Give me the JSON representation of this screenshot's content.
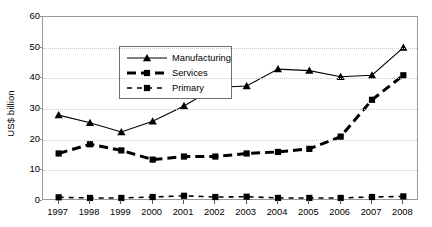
{
  "chart_data": {
    "type": "line",
    "title": "",
    "xlabel": "",
    "ylabel": "US$ billion",
    "ylim": [
      0,
      60
    ],
    "yticks": [
      0,
      10,
      20,
      30,
      40,
      50,
      60
    ],
    "grid": true,
    "legend_position": "upper-left-inside",
    "x": [
      1997,
      1998,
      1999,
      2000,
      2001,
      2002,
      2003,
      2004,
      2005,
      2006,
      2007,
      2008
    ],
    "categories": [
      "1997",
      "1998",
      "1999",
      "2000",
      "2001",
      "2002",
      "2003",
      "2004",
      "2005",
      "2006",
      "2007",
      "2008"
    ],
    "series": [
      {
        "name": "Manufacturing",
        "marker": "triangle",
        "line_style": "solid",
        "color": "#000000",
        "values": [
          28.0,
          25.5,
          22.5,
          26.0,
          31.0,
          37.0,
          37.5,
          43.0,
          42.5,
          40.5,
          41.0,
          50.0
        ]
      },
      {
        "name": "Services",
        "marker": "square",
        "line_style": "dashed-thick",
        "color": "#000000",
        "values": [
          15.5,
          18.5,
          16.5,
          13.5,
          14.5,
          14.5,
          15.5,
          16.0,
          17.0,
          21.0,
          33.0,
          41.0
        ]
      },
      {
        "name": "Primary",
        "marker": "square",
        "line_style": "dashed-thin",
        "color": "#000000",
        "values": [
          1.2,
          1.0,
          1.0,
          1.3,
          1.7,
          1.3,
          1.4,
          1.0,
          1.0,
          1.0,
          1.3,
          1.5
        ]
      }
    ]
  },
  "legend": {
    "items": [
      {
        "label": "Manufacturing"
      },
      {
        "label": "Services"
      },
      {
        "label": "Primary"
      }
    ]
  }
}
